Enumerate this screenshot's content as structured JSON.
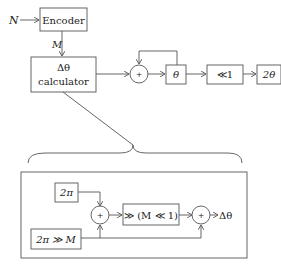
{
  "top": {
    "input_label": "N",
    "encoder_label": "Encoder",
    "encoder_output_label": "M",
    "calc_label_line1": "Δθ",
    "calc_label_line2": "calculator",
    "adder_symbol": "+",
    "theta_label": "θ",
    "shift_label": "≪1",
    "output_label": "2θ"
  },
  "detail": {
    "two_pi_label": "2π",
    "two_pi_shift_label": "2π ≫ M",
    "adder1_symbol": "+",
    "shift_block_label": "≫ (M ≪ 1)",
    "adder2_symbol": "+",
    "output_label": "Δθ"
  },
  "colors": {
    "line": "#555555",
    "text": "#222222"
  }
}
